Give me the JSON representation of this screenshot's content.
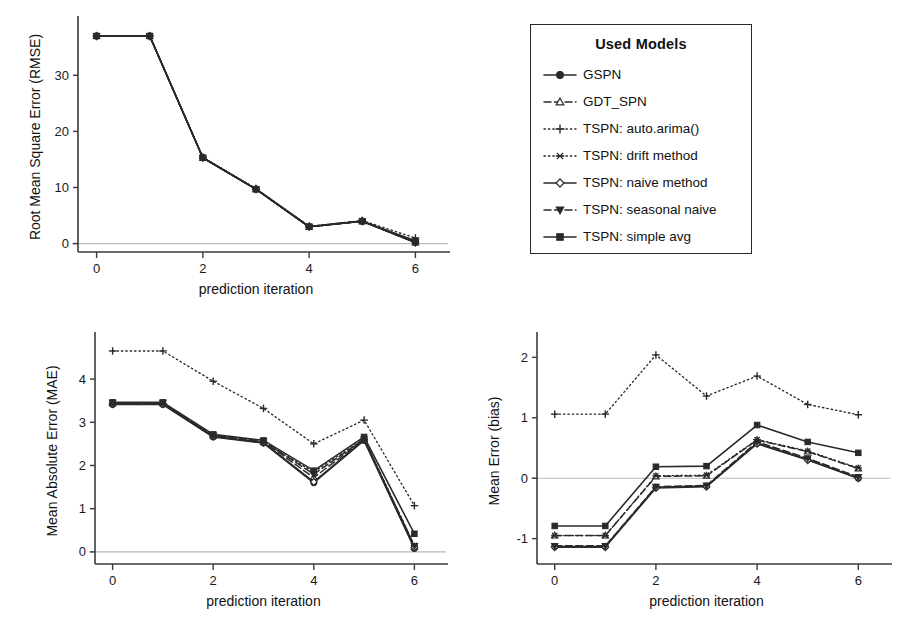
{
  "figure": {
    "xlabel": "prediction iteration",
    "x_ticks": [
      0,
      2,
      4,
      6
    ],
    "x_values": [
      0,
      1,
      2,
      3,
      4,
      5,
      6
    ]
  },
  "legend": {
    "title": "Used Models",
    "items": [
      {
        "label": "GSPN",
        "marker": "circle-filled",
        "line": "solid",
        "key_name": "legend-key-gspn"
      },
      {
        "label": "GDT_SPN",
        "marker": "triangle-open",
        "line": "dashed",
        "key_name": "legend-key-gdt-spn"
      },
      {
        "label": "TSPN: auto.arima()",
        "marker": "plus",
        "line": "dotted",
        "key_name": "legend-key-tspn-auto-arima"
      },
      {
        "label": "TSPN: drift method",
        "marker": "asterisk",
        "line": "dotted",
        "key_name": "legend-key-tspn-drift"
      },
      {
        "label": "TSPN: naive method",
        "marker": "diamond-open",
        "line": "solid",
        "key_name": "legend-key-tspn-naive"
      },
      {
        "label": "TSPN: seasonal naive",
        "marker": "triangle-down",
        "line": "dashed",
        "key_name": "legend-key-tspn-seasonal-naive"
      },
      {
        "label": "TSPN: simple avg",
        "marker": "square-filled",
        "line": "solid",
        "key_name": "legend-key-tspn-simple-avg"
      }
    ]
  },
  "chart_data": [
    {
      "id": "rmse",
      "type": "line",
      "title": "",
      "xlabel": "prediction iteration",
      "ylabel": "Root Mean Square Error (RMSE)",
      "x": [
        0,
        1,
        2,
        3,
        4,
        5,
        6
      ],
      "xlim": [
        -0.35,
        6.35
      ],
      "ylim": [
        -1.5,
        39.5
      ],
      "xticks": [
        0,
        2,
        4,
        6
      ],
      "yticks": [
        0,
        10,
        20,
        30
      ],
      "grid": false,
      "zero_line": 0,
      "legend_position": "outside-right",
      "series": [
        {
          "name": "GSPN",
          "marker": "circle-filled",
          "line": "solid",
          "values": [
            37.0,
            37.0,
            15.3,
            9.7,
            3.0,
            4.0,
            0.2
          ]
        },
        {
          "name": "GDT_SPN",
          "marker": "triangle-open",
          "line": "dashed",
          "values": [
            37.0,
            37.0,
            15.3,
            9.7,
            3.0,
            4.0,
            0.2
          ]
        },
        {
          "name": "TSPN: auto.arima()",
          "marker": "plus",
          "line": "dotted",
          "values": [
            37.0,
            37.0,
            15.4,
            9.8,
            3.1,
            4.1,
            1.0
          ]
        },
        {
          "name": "TSPN: drift method",
          "marker": "asterisk",
          "line": "dotted",
          "values": [
            37.0,
            37.0,
            15.3,
            9.7,
            3.0,
            4.0,
            0.3
          ]
        },
        {
          "name": "TSPN: naive method",
          "marker": "diamond-open",
          "line": "solid",
          "values": [
            37.0,
            37.0,
            15.3,
            9.7,
            3.0,
            4.0,
            0.2
          ]
        },
        {
          "name": "TSPN: seasonal naive",
          "marker": "triangle-down",
          "line": "dashed",
          "values": [
            37.0,
            37.0,
            15.3,
            9.7,
            3.0,
            4.0,
            0.2
          ]
        },
        {
          "name": "TSPN: simple avg",
          "marker": "square-filled",
          "line": "solid",
          "values": [
            37.0,
            37.0,
            15.3,
            9.7,
            3.0,
            4.0,
            0.5
          ]
        }
      ]
    },
    {
      "id": "mae",
      "type": "line",
      "title": "",
      "xlabel": "prediction iteration",
      "ylabel": "Mean Absolute Error (MAE)",
      "x": [
        0,
        1,
        2,
        3,
        4,
        5,
        6
      ],
      "xlim": [
        -0.35,
        6.35
      ],
      "ylim": [
        -0.28,
        4.95
      ],
      "xticks": [
        0,
        2,
        4,
        6
      ],
      "yticks": [
        0,
        1,
        2,
        3,
        4
      ],
      "grid": false,
      "zero_line": 0,
      "legend_position": "outside-right",
      "series": [
        {
          "name": "GSPN",
          "marker": "circle-filled",
          "line": "solid",
          "values": [
            3.41,
            3.41,
            2.66,
            2.52,
            1.6,
            2.58,
            0.08
          ]
        },
        {
          "name": "GDT_SPN",
          "marker": "triangle-open",
          "line": "dashed",
          "values": [
            3.44,
            3.44,
            2.69,
            2.55,
            1.72,
            2.6,
            0.12
          ]
        },
        {
          "name": "TSPN: auto.arima()",
          "marker": "plus",
          "line": "dotted",
          "values": [
            4.65,
            4.65,
            3.95,
            3.32,
            2.5,
            3.05,
            1.07
          ]
        },
        {
          "name": "TSPN: drift method",
          "marker": "asterisk",
          "line": "dotted",
          "values": [
            3.43,
            3.43,
            2.68,
            2.54,
            1.85,
            2.62,
            0.15
          ]
        },
        {
          "name": "TSPN: naive method",
          "marker": "diamond-open",
          "line": "solid",
          "values": [
            3.42,
            3.42,
            2.67,
            2.53,
            1.62,
            2.59,
            0.1
          ]
        },
        {
          "name": "TSPN: seasonal naive",
          "marker": "triangle-down",
          "line": "dashed",
          "values": [
            3.45,
            3.45,
            2.7,
            2.56,
            1.8,
            2.61,
            0.14
          ]
        },
        {
          "name": "TSPN: simple avg",
          "marker": "square-filled",
          "line": "solid",
          "values": [
            3.46,
            3.46,
            2.72,
            2.58,
            1.88,
            2.66,
            0.42
          ]
        }
      ]
    },
    {
      "id": "bias",
      "type": "line",
      "title": "",
      "xlabel": "prediction iteration",
      "ylabel": "Mean Error (bias)",
      "x": [
        0,
        1,
        2,
        3,
        4,
        5,
        6
      ],
      "xlim": [
        -0.35,
        6.35
      ],
      "ylim": [
        -1.42,
        2.32
      ],
      "xticks": [
        0,
        2,
        4,
        6
      ],
      "yticks": [
        -1,
        0,
        1,
        2
      ],
      "grid": false,
      "zero_line": 0,
      "legend_position": "outside-right",
      "series": [
        {
          "name": "GSPN",
          "marker": "circle-filled",
          "line": "solid",
          "values": [
            -1.13,
            -1.13,
            -0.15,
            -0.13,
            0.58,
            0.31,
            0.0
          ]
        },
        {
          "name": "GDT_SPN",
          "marker": "triangle-open",
          "line": "dashed",
          "values": [
            -0.95,
            -0.95,
            0.03,
            0.04,
            0.63,
            0.44,
            0.16
          ]
        },
        {
          "name": "TSPN: auto.arima()",
          "marker": "plus",
          "line": "dotted",
          "values": [
            1.06,
            1.06,
            2.04,
            1.36,
            1.69,
            1.22,
            1.05
          ]
        },
        {
          "name": "TSPN: drift method",
          "marker": "asterisk",
          "line": "dotted",
          "values": [
            -0.95,
            -0.95,
            0.04,
            0.05,
            0.64,
            0.45,
            0.17
          ]
        },
        {
          "name": "TSPN: naive method",
          "marker": "diamond-open",
          "line": "solid",
          "values": [
            -1.14,
            -1.14,
            -0.16,
            -0.14,
            0.57,
            0.3,
            0.0
          ]
        },
        {
          "name": "TSPN: seasonal naive",
          "marker": "triangle-down",
          "line": "dashed",
          "values": [
            -1.12,
            -1.12,
            -0.14,
            -0.12,
            0.6,
            0.33,
            0.02
          ]
        },
        {
          "name": "TSPN: simple avg",
          "marker": "square-filled",
          "line": "solid",
          "values": [
            -0.79,
            -0.79,
            0.19,
            0.2,
            0.88,
            0.6,
            0.42
          ]
        }
      ]
    }
  ]
}
